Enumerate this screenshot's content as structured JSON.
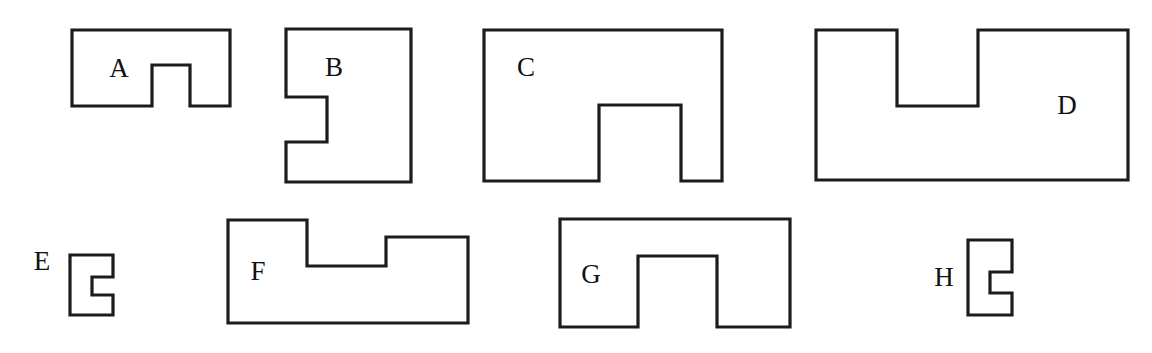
{
  "figure": {
    "background_color": "#ffffff",
    "stroke_color": "#1c1c1c",
    "label_color": "#111111",
    "canvas": {
      "width": 1152,
      "height": 353
    }
  },
  "shapes": [
    {
      "id": "A",
      "label": "A",
      "label_x": 119,
      "label_y": 71,
      "label_inside": true,
      "notch_edge": "bottom",
      "bounds": {
        "x": 72,
        "y": 30,
        "width": 158,
        "height": 76
      },
      "notch": {
        "x": 152,
        "y": 65,
        "width": 38,
        "height": 41
      },
      "path": "M 72 30 L 230 30 L 230 106 L 190 106 L 190 65 L 152 65 L 152 106 L 72 106 Z"
    },
    {
      "id": "B",
      "label": "B",
      "label_x": 334,
      "label_y": 70,
      "label_inside": true,
      "notch_edge": "left",
      "bounds": {
        "x": 286,
        "y": 29,
        "width": 125,
        "height": 153
      },
      "notch": {
        "x": 286,
        "y": 97,
        "width": 41,
        "height": 45
      },
      "path": "M 286 29 L 411 29 L 411 182 L 286 182 L 286 142 L 327 142 L 327 97 L 286 97 Z"
    },
    {
      "id": "C",
      "label": "C",
      "label_x": 526,
      "label_y": 70,
      "label_inside": true,
      "notch_edge": "bottom",
      "bounds": {
        "x": 484,
        "y": 30,
        "width": 238,
        "height": 151
      },
      "notch": {
        "x": 599,
        "y": 105,
        "width": 82,
        "height": 76
      },
      "path": "M 484 30 L 722 30 L 722 181 L 681 181 L 681 105 L 599 105 L 599 181 L 484 181 Z"
    },
    {
      "id": "D",
      "label": "D",
      "label_x": 1067,
      "label_y": 108,
      "label_inside": true,
      "notch_edge": "top",
      "bounds": {
        "x": 816,
        "y": 30,
        "width": 312,
        "height": 150
      },
      "notch": {
        "x": 897,
        "y": 30,
        "width": 81,
        "height": 76
      },
      "path": "M 816 30 L 897 30 L 897 106 L 978 106 L 978 30 L 1128 30 L 1128 180 L 816 180 Z"
    },
    {
      "id": "E",
      "label": "E",
      "label_x": 42,
      "label_y": 264,
      "label_inside": false,
      "notch_edge": "right",
      "bounds": {
        "x": 70,
        "y": 255,
        "width": 43,
        "height": 60
      },
      "notch": {
        "x": 92,
        "y": 277,
        "width": 21,
        "height": 18
      },
      "path": "M 70 255 L 113 255 L 113 277 L 92 277 L 92 295 L 113 295 L 113 315 L 70 315 Z"
    },
    {
      "id": "F",
      "label": "F",
      "label_x": 258,
      "label_y": 274,
      "label_inside": true,
      "notch_edge": "top",
      "bounds": {
        "x": 228,
        "y": 220,
        "width": 240,
        "height": 103
      },
      "notch": {
        "x": 307,
        "y": 220,
        "width": 79,
        "height": 46
      },
      "path": "M 228 220 L 307 220 L 307 266 L 386 266 L 386 237 L 468 237 L 468 323 L 228 323 Z"
    },
    {
      "id": "G",
      "label": "G",
      "label_x": 591,
      "label_y": 277,
      "label_inside": true,
      "notch_edge": "bottom",
      "bounds": {
        "x": 560,
        "y": 219,
        "width": 230,
        "height": 108
      },
      "notch": {
        "x": 638,
        "y": 256,
        "width": 79,
        "height": 71
      },
      "path": "M 560 219 L 790 219 L 790 327 L 717 327 L 717 256 L 638 256 L 638 327 L 560 327 Z"
    },
    {
      "id": "H",
      "label": "H",
      "label_x": 944,
      "label_y": 280,
      "label_inside": false,
      "notch_edge": "right",
      "bounds": {
        "x": 968,
        "y": 240,
        "width": 44,
        "height": 75
      },
      "notch": {
        "x": 990,
        "y": 272,
        "width": 22,
        "height": 21
      },
      "path": "M 968 240 L 1012 240 L 1012 272 L 990 272 L 990 293 L 1012 293 L 1012 315 L 968 315 Z"
    }
  ]
}
